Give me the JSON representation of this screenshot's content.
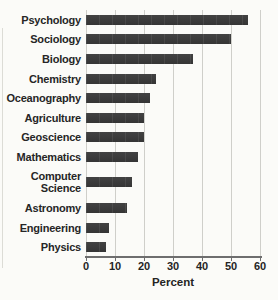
{
  "chart_data": {
    "type": "bar",
    "orientation": "horizontal",
    "title": "",
    "xlabel": "Percent",
    "ylabel": "",
    "xlim": [
      0,
      60
    ],
    "xticks": [
      0,
      10,
      20,
      30,
      40,
      50,
      60
    ],
    "grid": true,
    "categories": [
      "Psychology",
      "Sociology",
      "Biology",
      "Chemistry",
      "Oceanography",
      "Agriculture",
      "Geoscience",
      "Mathematics",
      "Computer Science",
      "Astronomy",
      "Engineering",
      "Physics"
    ],
    "values": [
      56,
      50,
      37,
      24,
      22,
      20,
      20,
      18,
      16,
      14,
      8,
      7
    ],
    "bar_color": "#3b3b3b",
    "gridline_color": "#cfcfca",
    "axis_color": "#6e6e6e",
    "background_color": "#fbfbf8",
    "legend": null
  }
}
